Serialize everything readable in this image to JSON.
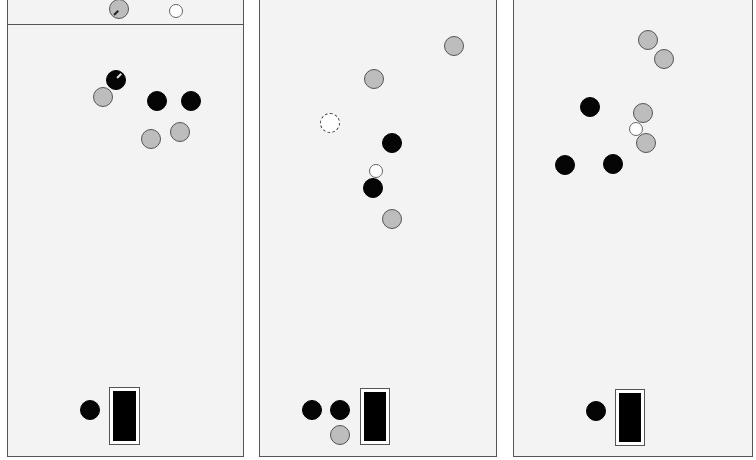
{
  "colors": {
    "panel_bg": "#f3f3f3",
    "border": "#555555",
    "black_piece": "#050505",
    "gray_piece": "#bdbdbd",
    "white_piece": "#ffffff"
  },
  "panels": [
    {
      "id": "panel-1",
      "rect": {
        "x": 7,
        "y": -2,
        "w": 237,
        "h": 459
      },
      "divider_y": 24,
      "pieces": [
        {
          "type": "gray",
          "x": 119,
          "y": 9,
          "r": 10,
          "marked": true
        },
        {
          "type": "white",
          "x": 176,
          "y": 11,
          "r": 7
        },
        {
          "type": "black",
          "x": 116,
          "y": 80,
          "r": 10,
          "marked": true
        },
        {
          "type": "gray",
          "x": 103,
          "y": 97,
          "r": 10
        },
        {
          "type": "black",
          "x": 157,
          "y": 101,
          "r": 10
        },
        {
          "type": "black",
          "x": 191,
          "y": 101,
          "r": 10
        },
        {
          "type": "gray",
          "x": 180,
          "y": 132,
          "r": 10
        },
        {
          "type": "gray",
          "x": 151,
          "y": 139,
          "r": 10
        },
        {
          "type": "black",
          "x": 90,
          "y": 410,
          "r": 10
        }
      ],
      "goal": {
        "x": 109,
        "y": 387,
        "w": 31,
        "h": 58
      }
    },
    {
      "id": "panel-2",
      "rect": {
        "x": 259,
        "y": -2,
        "w": 238,
        "h": 459
      },
      "pieces": [
        {
          "type": "gray",
          "x": 454,
          "y": 46,
          "r": 10
        },
        {
          "type": "gray",
          "x": 374,
          "y": 79,
          "r": 10
        },
        {
          "type": "dashed",
          "x": 330,
          "y": 123,
          "r": 10
        },
        {
          "type": "black",
          "x": 392,
          "y": 143,
          "r": 10
        },
        {
          "type": "white",
          "x": 376,
          "y": 171,
          "r": 7
        },
        {
          "type": "black",
          "x": 373,
          "y": 188,
          "r": 10
        },
        {
          "type": "gray",
          "x": 392,
          "y": 219,
          "r": 10
        },
        {
          "type": "black",
          "x": 312,
          "y": 410,
          "r": 10
        },
        {
          "type": "black",
          "x": 340,
          "y": 410,
          "r": 10
        },
        {
          "type": "gray",
          "x": 340,
          "y": 435,
          "r": 10
        }
      ],
      "goal": {
        "x": 360,
        "y": 388,
        "w": 30,
        "h": 57
      }
    },
    {
      "id": "panel-3",
      "rect": {
        "x": 513,
        "y": -2,
        "w": 240,
        "h": 459
      },
      "pieces": [
        {
          "type": "gray",
          "x": 648,
          "y": 40,
          "r": 10
        },
        {
          "type": "gray",
          "x": 664,
          "y": 59,
          "r": 10
        },
        {
          "type": "black",
          "x": 590,
          "y": 107,
          "r": 10
        },
        {
          "type": "gray",
          "x": 643,
          "y": 113,
          "r": 10
        },
        {
          "type": "white",
          "x": 636,
          "y": 129,
          "r": 7
        },
        {
          "type": "gray",
          "x": 646,
          "y": 143,
          "r": 10
        },
        {
          "type": "black",
          "x": 613,
          "y": 164,
          "r": 10
        },
        {
          "type": "black",
          "x": 565,
          "y": 165,
          "r": 10
        },
        {
          "type": "black",
          "x": 596,
          "y": 411,
          "r": 10
        }
      ],
      "goal": {
        "x": 615,
        "y": 389,
        "w": 30,
        "h": 57
      }
    }
  ]
}
